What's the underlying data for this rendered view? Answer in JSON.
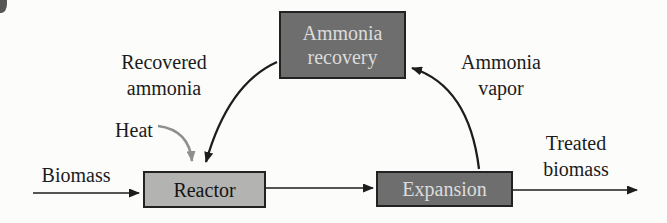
{
  "diagram": {
    "type": "process-flow",
    "nodes": [
      {
        "id": "ammonia_recovery",
        "label_line1": "Ammonia",
        "label_line2": "recovery",
        "style": "dark"
      },
      {
        "id": "reactor",
        "label": "Reactor",
        "style": "light"
      },
      {
        "id": "expansion",
        "label": "Expansion",
        "style": "dark"
      }
    ],
    "flow_labels": {
      "biomass": "Biomass",
      "recovered_ammonia": {
        "line1": "Recovered",
        "line2": "ammonia"
      },
      "heat": "Heat",
      "ammonia_vapor": {
        "line1": "Ammonia",
        "line2": "vapor"
      },
      "treated_biomass": {
        "line1": "Treated",
        "line2": "biomass"
      }
    },
    "edges": [
      {
        "from": "biomass-input",
        "to": "reactor",
        "label": "Biomass"
      },
      {
        "from": "reactor",
        "to": "expansion",
        "label": ""
      },
      {
        "from": "expansion",
        "to": "treated-biomass-output",
        "label": "Treated biomass"
      },
      {
        "from": "expansion",
        "to": "ammonia_recovery",
        "label": "Ammonia vapor"
      },
      {
        "from": "ammonia_recovery",
        "to": "reactor",
        "label": "Recovered ammonia"
      },
      {
        "from": "heat-input",
        "to": "reactor",
        "label": "Heat"
      }
    ],
    "colors": {
      "background": "#fcfcfb",
      "box_border": "#222222",
      "dark_box_fill": "#6e6e6e",
      "dark_box_text": "#dcdcdc",
      "light_box_fill": "#b3b3b1",
      "light_box_text": "#141414",
      "arrow": "#1d1d1d",
      "heat_arrow": "#8f8f8f",
      "label_text": "#1b1b1b"
    }
  }
}
